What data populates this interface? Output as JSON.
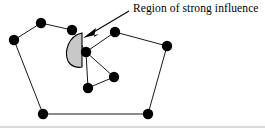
{
  "figure": {
    "title": "Region of strong influence",
    "width": 265,
    "height": 128,
    "background_color": "#ffffff",
    "annotation": {
      "label": "Region of strong influence",
      "label_x": 133,
      "label_y": 1,
      "font_size": 11.5,
      "color": "#000000",
      "leader_line": {
        "x1": 129,
        "y1": 11,
        "x2": 92,
        "y2": 33
      },
      "arrowhead": {
        "name": "arrow-pointing-to-region",
        "points": "83,38 96,28 94,37 99,34",
        "color": "#000000"
      }
    },
    "influence_region": {
      "name": "region-of-strong-influence",
      "shape": "half-disc-D",
      "fill_color": "#c8c8c8",
      "stroke_color": "#000000",
      "path": "M 82,33 C 68,36 64,52 68,61 C 71,67 78,68 82,67 Z"
    },
    "frame": {
      "bottom_rule": {
        "x1": 0,
        "y1": 127,
        "x2": 265,
        "y2": 127,
        "color": "#b4b4b4"
      }
    },
    "node_radius": 5.2,
    "node_color": "#000000",
    "edge_color": "#1a1a1a",
    "nodes": [
      {
        "id": "n1",
        "label": "outer-left",
        "x": 14,
        "y": 40
      },
      {
        "id": "n2",
        "label": "outer-top-left",
        "x": 41,
        "y": 23
      },
      {
        "id": "n3",
        "label": "outer-top-mid",
        "x": 72,
        "y": 30
      },
      {
        "id": "n4",
        "label": "outer-top-right",
        "x": 115,
        "y": 32
      },
      {
        "id": "n5",
        "label": "outer-right",
        "x": 167,
        "y": 46
      },
      {
        "id": "n6",
        "label": "outer-bottom-right",
        "x": 148,
        "y": 114
      },
      {
        "id": "n7",
        "label": "outer-bottom-left",
        "x": 43,
        "y": 114
      },
      {
        "id": "n8",
        "label": "inner-upper",
        "x": 86,
        "y": 52
      },
      {
        "id": "n9",
        "label": "inner-right",
        "x": 114,
        "y": 77
      },
      {
        "id": "n10",
        "label": "inner-lower",
        "x": 88,
        "y": 88
      }
    ],
    "edges": [
      {
        "from": "n1",
        "to": "n2"
      },
      {
        "from": "n2",
        "to": "n3"
      },
      {
        "from": "n3",
        "to": "n8"
      },
      {
        "from": "n1",
        "to": "n7"
      },
      {
        "from": "n7",
        "to": "n6"
      },
      {
        "from": "n6",
        "to": "n5"
      },
      {
        "from": "n5",
        "to": "n4"
      },
      {
        "from": "n4",
        "to": "n8"
      },
      {
        "from": "n8",
        "to": "n9"
      },
      {
        "from": "n9",
        "to": "n10"
      },
      {
        "from": "n10",
        "to": "n8"
      }
    ]
  }
}
